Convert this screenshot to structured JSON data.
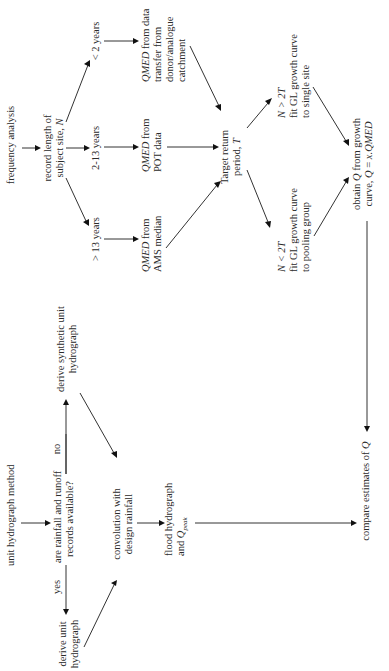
{
  "diagram": {
    "title": "",
    "orientation": "rotated-90-ccw",
    "frequency_branch": {
      "start": "frequency analysis",
      "record_length": [
        "record length of",
        "subject site, N"
      ],
      "branches": [
        {
          "condition": "< 2 years",
          "result": [
            "QMED from data",
            "transfer from",
            "donor/analogue",
            "catchment"
          ]
        },
        {
          "condition": "2-13 years",
          "result": [
            "QMED from",
            "POT data"
          ]
        },
        {
          "condition": "> 13 years",
          "result": [
            "QMED from",
            "AMS median"
          ]
        }
      ],
      "target": [
        "Target return",
        "period, T"
      ],
      "growth_options": [
        {
          "condition": "N > 2T",
          "lines": [
            "fit GL growth curve",
            "to single site"
          ]
        },
        {
          "condition": "N < 2T",
          "lines": [
            "fit GL growth curve",
            "to pooling group"
          ]
        }
      ],
      "obtain": [
        "obtain Q from growth",
        "curve, Q = x.QMED"
      ]
    },
    "unit_hydrograph_branch": {
      "start": "unit hydrograph method",
      "question": [
        "are rainfall and runoff",
        "records available?"
      ],
      "yes_label": "yes",
      "no_label": "no",
      "yes_result": [
        "derive unit",
        "hydrograph"
      ],
      "no_result": [
        "derive synthetic unit",
        "hydrograph"
      ],
      "convolution": [
        "convolution with",
        "design rainfall"
      ],
      "flood": [
        "flood hydrograph",
        "and Q",
        "peak"
      ]
    },
    "final": "compare estimates of Q"
  }
}
